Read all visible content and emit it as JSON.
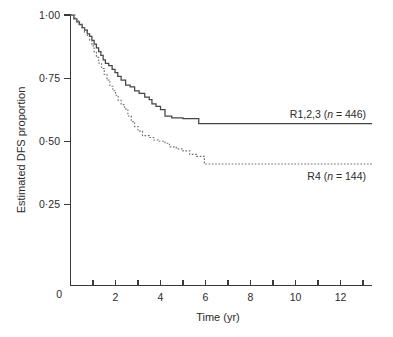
{
  "chart_data": {
    "type": "line",
    "title": "",
    "xlabel": "Time (yr)",
    "ylabel": "Estimated DFS proportion",
    "xlim": [
      0,
      13.4
    ],
    "ylim": [
      0,
      1.0
    ],
    "grid": false,
    "legend_position": "inline-right",
    "x_ticks_major": [
      0,
      2,
      4,
      6,
      8,
      10,
      12
    ],
    "x_tick_labels": [
      "0",
      "2",
      "4",
      "6",
      "8",
      "10",
      "12"
    ],
    "x_ticks_minor": [
      1,
      3,
      5,
      7,
      9,
      11,
      13
    ],
    "y_ticks": [
      0.25,
      0.5,
      0.75,
      1.0
    ],
    "y_tick_labels": [
      "0·25",
      "0·50",
      "0·75",
      "1·00"
    ],
    "y_origin_label": "0",
    "series": [
      {
        "name": "R1,2,3",
        "label_text": "R1,2,3 (",
        "label_italic": "n",
        "label_tail": " = 446)",
        "n": 446,
        "style": "solid",
        "color": "#454545",
        "plateau_value": 0.57,
        "steps": [
          [
            0.0,
            1.0
          ],
          [
            0.15,
            0.985
          ],
          [
            0.28,
            0.973
          ],
          [
            0.4,
            0.962
          ],
          [
            0.52,
            0.95
          ],
          [
            0.63,
            0.94
          ],
          [
            0.75,
            0.925
          ],
          [
            0.85,
            0.915
          ],
          [
            0.95,
            0.9
          ],
          [
            1.05,
            0.885
          ],
          [
            1.15,
            0.87
          ],
          [
            1.25,
            0.855
          ],
          [
            1.35,
            0.84
          ],
          [
            1.45,
            0.822
          ],
          [
            1.55,
            0.808
          ],
          [
            1.7,
            0.8
          ],
          [
            1.85,
            0.785
          ],
          [
            1.98,
            0.772
          ],
          [
            2.1,
            0.757
          ],
          [
            2.25,
            0.742
          ],
          [
            2.45,
            0.722
          ],
          [
            2.65,
            0.715
          ],
          [
            2.85,
            0.7
          ],
          [
            3.05,
            0.69
          ],
          [
            3.3,
            0.675
          ],
          [
            3.5,
            0.665
          ],
          [
            3.62,
            0.648
          ],
          [
            3.8,
            0.638
          ],
          [
            4.0,
            0.625
          ],
          [
            4.2,
            0.6
          ],
          [
            4.5,
            0.593
          ],
          [
            5.0,
            0.59
          ],
          [
            5.7,
            0.57
          ],
          [
            13.4,
            0.57
          ]
        ]
      },
      {
        "name": "R4",
        "label_text": "R4 (",
        "label_italic": "n",
        "label_tail": " = 144)",
        "n": 144,
        "style": "dotted",
        "color": "#6e6e6e",
        "plateau_value": 0.41,
        "steps": [
          [
            0.0,
            1.0
          ],
          [
            0.2,
            0.982
          ],
          [
            0.35,
            0.965
          ],
          [
            0.5,
            0.95
          ],
          [
            0.62,
            0.932
          ],
          [
            0.75,
            0.915
          ],
          [
            0.85,
            0.9
          ],
          [
            0.95,
            0.878
          ],
          [
            1.05,
            0.855
          ],
          [
            1.15,
            0.832
          ],
          [
            1.25,
            0.81
          ],
          [
            1.38,
            0.788
          ],
          [
            1.5,
            0.765
          ],
          [
            1.62,
            0.742
          ],
          [
            1.75,
            0.718
          ],
          [
            1.88,
            0.7
          ],
          [
            2.0,
            0.682
          ],
          [
            2.12,
            0.662
          ],
          [
            2.25,
            0.645
          ],
          [
            2.4,
            0.628
          ],
          [
            2.55,
            0.6
          ],
          [
            2.7,
            0.578
          ],
          [
            2.85,
            0.558
          ],
          [
            3.0,
            0.54
          ],
          [
            3.2,
            0.522
          ],
          [
            3.5,
            0.515
          ],
          [
            3.7,
            0.505
          ],
          [
            3.9,
            0.5
          ],
          [
            4.2,
            0.492
          ],
          [
            4.4,
            0.478
          ],
          [
            4.7,
            0.47
          ],
          [
            5.0,
            0.462
          ],
          [
            5.3,
            0.448
          ],
          [
            5.6,
            0.44
          ],
          [
            5.95,
            0.41
          ],
          [
            13.4,
            0.41
          ]
        ]
      }
    ]
  }
}
